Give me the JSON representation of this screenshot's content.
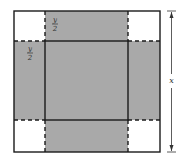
{
  "diagram": {
    "labels": {
      "top_flap_num": "y",
      "top_flap_den": "2",
      "left_flap_num": "y",
      "left_flap_den": "2",
      "side": "x"
    },
    "colors": {
      "shaded": "#a9a9a9",
      "corner": "#ffffff",
      "line": "#1a1a1a"
    }
  }
}
